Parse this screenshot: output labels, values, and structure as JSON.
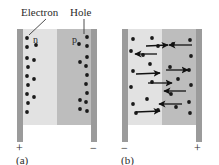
{
  "figure": {
    "type": "diagram",
    "background_color": "#ffffff"
  },
  "colors": {
    "electrode": "#9b9b9b",
    "n_region": "#e2e2e2",
    "p_region": "#bdbdbd",
    "carrier_dot": "#1a1a1a",
    "arrow": "#111111",
    "text": "#2b2b2b",
    "leader_line": "#3a3a3a"
  },
  "annotations": {
    "electron_label": "Electron",
    "hole_label": "Hole"
  },
  "panels": [
    {
      "id": "a",
      "caption": "(a)",
      "left_terminal": "+",
      "right_terminal": "−",
      "regions": [
        {
          "name": "n",
          "label": "n",
          "type": "n-type"
        },
        {
          "name": "p",
          "label": "p",
          "type": "p-type"
        }
      ],
      "body": {
        "x": 17,
        "y": 29,
        "width": 80,
        "height": 96
      },
      "left_electrode": {
        "x": 17,
        "y": 29,
        "width": 6,
        "height": 113
      },
      "right_electrode": {
        "x": 91,
        "y": 29,
        "width": 6,
        "height": 113
      },
      "n_region_rect": {
        "x": 23,
        "y": 29,
        "width": 34,
        "height": 96
      },
      "p_region_rect": {
        "x": 57,
        "y": 29,
        "width": 34,
        "height": 96
      },
      "n_label_pos": {
        "x": 33,
        "y": 42
      },
      "p_label_pos": {
        "x": 73,
        "y": 42
      },
      "carriers": [
        {
          "x": 27,
          "y": 38
        },
        {
          "x": 36,
          "y": 45
        },
        {
          "x": 27,
          "y": 47
        },
        {
          "x": 27,
          "y": 58
        },
        {
          "x": 28,
          "y": 67
        },
        {
          "x": 27,
          "y": 76
        },
        {
          "x": 28,
          "y": 85
        },
        {
          "x": 27,
          "y": 94
        },
        {
          "x": 28,
          "y": 103
        },
        {
          "x": 27,
          "y": 112
        },
        {
          "x": 34,
          "y": 60
        },
        {
          "x": 34,
          "y": 79
        },
        {
          "x": 34,
          "y": 97
        },
        {
          "x": 87,
          "y": 37
        },
        {
          "x": 79,
          "y": 44
        },
        {
          "x": 87,
          "y": 46
        },
        {
          "x": 87,
          "y": 57
        },
        {
          "x": 86,
          "y": 66
        },
        {
          "x": 87,
          "y": 75
        },
        {
          "x": 86,
          "y": 84
        },
        {
          "x": 87,
          "y": 93
        },
        {
          "x": 86,
          "y": 102
        },
        {
          "x": 87,
          "y": 111
        },
        {
          "x": 80,
          "y": 62
        },
        {
          "x": 80,
          "y": 100
        },
        {
          "x": 80,
          "y": 109
        }
      ],
      "leaders": [
        {
          "name": "electron-leader",
          "x1": 46,
          "y1": 18,
          "x2": 28,
          "y2": 35
        },
        {
          "name": "hole-leader",
          "x1": 84,
          "y1": 18,
          "x2": 84,
          "y2": 35
        }
      ],
      "electron_label_pos": {
        "x": 22,
        "y": 16
      },
      "hole_label_pos": {
        "x": 70,
        "y": 16
      },
      "plus_pos": {
        "x": 17,
        "y": 152
      },
      "minus_pos": {
        "x": 90,
        "y": 152
      },
      "caption_pos": {
        "x": 17,
        "y": 164
      }
    },
    {
      "id": "b",
      "caption": "(b)",
      "left_terminal": "−",
      "right_terminal": "+",
      "regions": [
        {
          "name": "n",
          "label": "",
          "type": "n-type"
        },
        {
          "name": "p",
          "label": "",
          "type": "p-type"
        }
      ],
      "body": {
        "x": 122,
        "y": 29,
        "width": 80,
        "height": 96
      },
      "left_electrode": {
        "x": 122,
        "y": 29,
        "width": 6,
        "height": 113
      },
      "right_electrode": {
        "x": 196,
        "y": 29,
        "width": 6,
        "height": 113
      },
      "n_region_rect": {
        "x": 128,
        "y": 29,
        "width": 34,
        "height": 96
      },
      "p_region_rect": {
        "x": 162,
        "y": 29,
        "width": 34,
        "height": 96
      },
      "carriers": [
        {
          "x": 133,
          "y": 39
        },
        {
          "x": 152,
          "y": 38
        },
        {
          "x": 131,
          "y": 51
        },
        {
          "x": 158,
          "y": 46
        },
        {
          "x": 133,
          "y": 71
        },
        {
          "x": 150,
          "y": 64
        },
        {
          "x": 131,
          "y": 87
        },
        {
          "x": 152,
          "y": 82
        },
        {
          "x": 133,
          "y": 104
        },
        {
          "x": 147,
          "y": 99
        },
        {
          "x": 136,
          "y": 113
        },
        {
          "x": 158,
          "y": 110
        },
        {
          "x": 143,
          "y": 55
        },
        {
          "x": 190,
          "y": 40
        },
        {
          "x": 173,
          "y": 44
        },
        {
          "x": 191,
          "y": 56
        },
        {
          "x": 170,
          "y": 67
        },
        {
          "x": 189,
          "y": 70
        },
        {
          "x": 178,
          "y": 79
        },
        {
          "x": 191,
          "y": 85
        },
        {
          "x": 171,
          "y": 94
        },
        {
          "x": 189,
          "y": 102
        },
        {
          "x": 176,
          "y": 107
        },
        {
          "x": 190,
          "y": 113
        }
      ],
      "arrows": [
        {
          "x1": 146,
          "y1": 46,
          "x2": 170,
          "y2": 45,
          "dir": "right"
        },
        {
          "x1": 157,
          "y1": 54,
          "x2": 133,
          "y2": 54,
          "dir": "left"
        },
        {
          "x1": 192,
          "y1": 45,
          "x2": 167,
          "y2": 45,
          "dir": "left"
        },
        {
          "x1": 136,
          "y1": 74,
          "x2": 162,
          "y2": 73,
          "dir": "right"
        },
        {
          "x1": 166,
          "y1": 70,
          "x2": 190,
          "y2": 70,
          "dir": "right"
        },
        {
          "x1": 148,
          "y1": 83,
          "x2": 172,
          "y2": 83,
          "dir": "right"
        },
        {
          "x1": 186,
          "y1": 91,
          "x2": 162,
          "y2": 91,
          "dir": "left"
        },
        {
          "x1": 182,
          "y1": 104,
          "x2": 157,
          "y2": 104,
          "dir": "left"
        },
        {
          "x1": 136,
          "y1": 112,
          "x2": 162,
          "y2": 111,
          "dir": "right"
        }
      ],
      "minus_pos": {
        "x": 122,
        "y": 152
      },
      "plus_pos": {
        "x": 195,
        "y": 152
      },
      "caption_pos": {
        "x": 122,
        "y": 164
      }
    }
  ]
}
